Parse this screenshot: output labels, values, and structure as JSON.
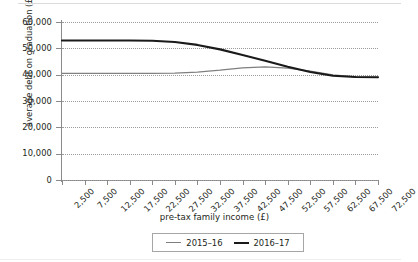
{
  "chart_data": {
    "type": "line",
    "title": "",
    "xlabel": "pre-tax family income (£)",
    "ylabel": "average debt on graduation (£)",
    "categories": [
      "2,500",
      "7,500",
      "12,500",
      "17,500",
      "22,500",
      "27,500",
      "32,500",
      "37,500",
      "42,500",
      "47,500",
      "52,500",
      "57,500",
      "62,500",
      "67,500",
      "72,500"
    ],
    "ytick_labels": [
      "0",
      "10,000",
      "20,000",
      "30,000",
      "40,000",
      "50,000",
      "60,000"
    ],
    "ytick_values": [
      0,
      10000,
      20000,
      30000,
      40000,
      50000,
      60000
    ],
    "ylim": [
      0,
      60000
    ],
    "grid": "horizontal-dotted",
    "legend_position": "bottom-center",
    "series": [
      {
        "name": "2015–16",
        "color": "#7f7f7f",
        "values": [
          40500,
          40500,
          40500,
          40500,
          40500,
          40600,
          41000,
          41700,
          42600,
          43000,
          42500,
          41300,
          39900,
          39200,
          39000
        ]
      },
      {
        "name": "2016–17",
        "color": "#1a1a1a",
        "values": [
          53000,
          53000,
          53000,
          53000,
          52900,
          52400,
          51300,
          49600,
          47500,
          45300,
          43000,
          41000,
          39600,
          39100,
          39000
        ]
      }
    ]
  },
  "legend": {
    "items": [
      {
        "label": "2015–16"
      },
      {
        "label": "2016–17"
      }
    ]
  }
}
